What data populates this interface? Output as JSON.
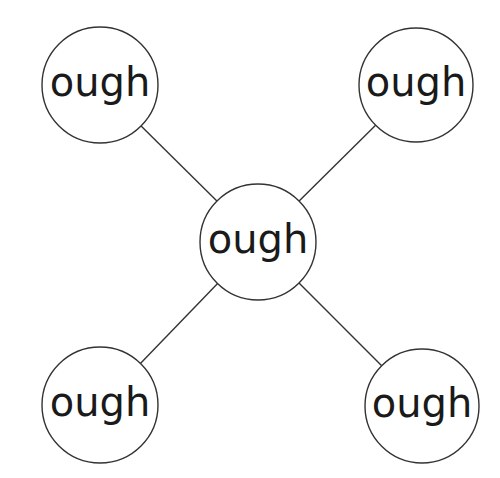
{
  "diagram": {
    "type": "spider-diagram",
    "colors": {
      "stroke": "#333333",
      "text": "#1a1a1a",
      "background": "#ffffff"
    },
    "center": {
      "id": "center",
      "label": "ough",
      "cx": 258,
      "cy": 242,
      "r": 58
    },
    "nodes": [
      {
        "id": "top-left",
        "label": "ough",
        "cx": 100,
        "cy": 85,
        "r": 58
      },
      {
        "id": "top-right",
        "label": "ough",
        "cx": 416,
        "cy": 85,
        "r": 57
      },
      {
        "id": "bottom-left",
        "label": "ough",
        "cx": 100,
        "cy": 405,
        "r": 58
      },
      {
        "id": "bottom-right",
        "label": "ough",
        "cx": 422,
        "cy": 406,
        "r": 57
      }
    ]
  }
}
